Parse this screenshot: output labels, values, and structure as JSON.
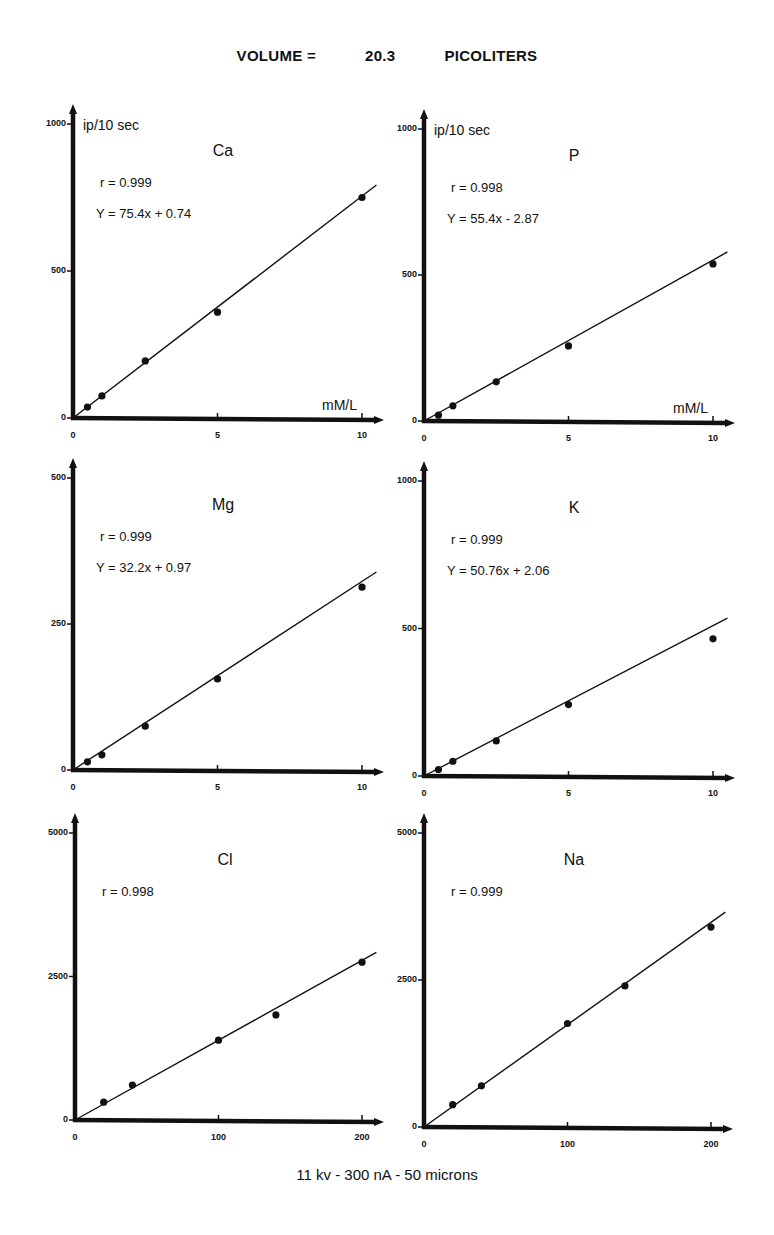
{
  "header": {
    "volume_label": "VOLUME =",
    "volume_value": "20.3",
    "volume_unit": "PICOLITERS"
  },
  "footer": {
    "conditions": "11 kv   -   300 nA  -  50 microns"
  },
  "y_unit_label": "ip/10 sec",
  "x_unit_label": "mM/L",
  "chart_data": [
    {
      "type": "scatter",
      "title": "Ca",
      "r": "r = 0.999",
      "equation": "Y = 75.4x + 0.74",
      "fit": {
        "slope": 75.4,
        "intercept": 0.74
      },
      "xlabel": "mM/L",
      "ylabel": "ip/10 sec",
      "xlim": [
        0,
        10
      ],
      "ylim": [
        0,
        1000
      ],
      "xticks": [
        "0",
        "5",
        "10"
      ],
      "yticks": [
        "0",
        "500",
        "1000"
      ],
      "x": [
        0.5,
        1,
        2.5,
        5,
        10
      ],
      "y": [
        37,
        75,
        194,
        360,
        750
      ]
    },
    {
      "type": "scatter",
      "title": "P",
      "r": "r = 0.998",
      "equation": "Y = 55.4x - 2.87",
      "fit": {
        "slope": 55.4,
        "intercept": -2.87
      },
      "xlabel": "mM/L",
      "ylabel": "ip/10 sec",
      "xlim": [
        0,
        10
      ],
      "ylim": [
        0,
        1000
      ],
      "xticks": [
        "0",
        "5",
        "10"
      ],
      "yticks": [
        "0",
        "500",
        "1000"
      ],
      "x": [
        0.5,
        1,
        2.5,
        5,
        10
      ],
      "y": [
        20,
        52,
        134,
        257,
        538
      ]
    },
    {
      "type": "scatter",
      "title": "Mg",
      "r": "r = 0.999",
      "equation": "Y = 32.2x + 0.97",
      "fit": {
        "slope": 32.2,
        "intercept": 0.97
      },
      "xlabel": "mM/L",
      "ylabel": "ip/10 sec",
      "xlim": [
        0,
        10
      ],
      "ylim": [
        0,
        500
      ],
      "xticks": [
        "0",
        "5",
        "10"
      ],
      "yticks": [
        "0",
        "250",
        "500"
      ],
      "x": [
        0.5,
        1,
        2.5,
        5,
        10
      ],
      "y": [
        14,
        26,
        75,
        156,
        313
      ]
    },
    {
      "type": "scatter",
      "title": "K",
      "r": "r = 0.999",
      "equation": "Y = 50.76x + 2.06",
      "fit": {
        "slope": 50.76,
        "intercept": 2.06
      },
      "xlabel": "mM/L",
      "ylabel": "ip/10 sec",
      "xlim": [
        0,
        10
      ],
      "ylim": [
        0,
        1000
      ],
      "xticks": [
        "0",
        "5",
        "10"
      ],
      "yticks": [
        "0",
        "500",
        "1000"
      ],
      "x": [
        0.5,
        1,
        2.5,
        5,
        10
      ],
      "y": [
        22,
        50,
        119,
        242,
        465
      ]
    },
    {
      "type": "scatter",
      "title": "Cl",
      "r": "r = 0.998",
      "equation": "",
      "fit": {
        "slope": 13.9,
        "intercept": 0
      },
      "xlabel": "mM/L",
      "ylabel": "ip/10 sec",
      "xlim": [
        0,
        200
      ],
      "ylim": [
        0,
        5000
      ],
      "xticks": [
        "0",
        "100",
        "200"
      ],
      "yticks": [
        "0",
        "2500",
        "5000"
      ],
      "x": [
        20,
        40,
        100,
        140,
        200
      ],
      "y": [
        310,
        610,
        1390,
        1830,
        2750
      ]
    },
    {
      "type": "scatter",
      "title": "Na",
      "r": "r = 0.999",
      "equation": "",
      "fit": {
        "slope": 17.4,
        "intercept": 0
      },
      "xlabel": "mM/L",
      "ylabel": "ip/10 sec",
      "xlim": [
        0,
        200
      ],
      "ylim": [
        0,
        5000
      ],
      "xticks": [
        "0",
        "100",
        "200"
      ],
      "yticks": [
        "0",
        "2500",
        "5000"
      ],
      "x": [
        20,
        40,
        100,
        140,
        200
      ],
      "y": [
        380,
        700,
        1760,
        2400,
        3400
      ]
    }
  ]
}
